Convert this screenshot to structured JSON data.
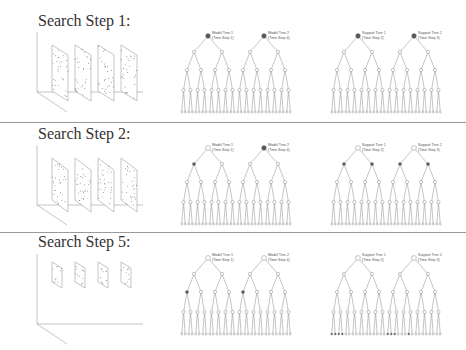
{
  "colors": {
    "line": "#8a8a8a",
    "node_fill": "#ffffff",
    "active_node": "#555555",
    "divider": "#9a9a9a",
    "title": "#333333"
  },
  "rows": [
    {
      "title": "Search Step 1:",
      "planes_scale": "large",
      "trees": [
        {
          "name": "Model Tree 1",
          "time_step": "(Time Step 1)",
          "active_level": 0,
          "active_index": [
            0
          ]
        },
        {
          "name": "Model Tree 2",
          "time_step": "(Time Step 4)",
          "active_level": 0,
          "active_index": [
            0
          ]
        },
        {
          "name": "Support Tree 1",
          "time_step": "(Time Step 2)",
          "active_level": 0,
          "active_index": [
            0
          ]
        },
        {
          "name": "Support Tree 2",
          "time_step": "(Time Step 3)",
          "active_level": 0,
          "active_index": [
            0
          ]
        }
      ]
    },
    {
      "title": "Search Step 2:",
      "planes_scale": "medium",
      "trees": [
        {
          "name": "Model Tree 1",
          "time_step": "(Time Step 1)",
          "active_level": 1,
          "active_index": [
            0
          ]
        },
        {
          "name": "Model Tree 2",
          "time_step": "(Time Step 4)",
          "active_level": 0,
          "active_index": [
            0
          ]
        },
        {
          "name": "Support Tree 1",
          "time_step": "(Time Step 2)",
          "active_level": 1,
          "active_index": [
            0,
            1
          ]
        },
        {
          "name": "Support Tree 2",
          "time_step": "(Time Step 3)",
          "active_level": 1,
          "active_index": [
            0,
            1
          ]
        }
      ]
    },
    {
      "title": "Search Step 5:",
      "planes_scale": "small",
      "trees": [
        {
          "name": "Model Tree 1",
          "time_step": "(Time Step 1)",
          "active_level": 2,
          "active_index": [
            0
          ]
        },
        {
          "name": "Model Tree 2",
          "time_step": "(Time Step 4)",
          "active_level": 2,
          "active_index": [
            0
          ]
        },
        {
          "name": "Support Tree 1",
          "time_step": "(Time Step 2)",
          "active_level": 4,
          "active_index": [
            0,
            1,
            2,
            3
          ]
        },
        {
          "name": "Support Tree 2",
          "time_step": "(Time Step 3)",
          "active_level": 4,
          "active_index": [
            0,
            1,
            2,
            6
          ]
        }
      ]
    }
  ],
  "tree_structure": {
    "branching": 2,
    "depth": 4,
    "leaves": 16
  },
  "planes_per_step": 4
}
